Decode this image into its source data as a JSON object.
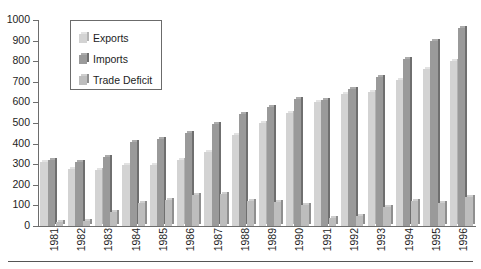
{
  "chart_data": {
    "type": "bar",
    "title": "",
    "xlabel": "",
    "ylabel": "",
    "grid": false,
    "legend_position": "top-left-inset",
    "ylim": [
      0,
      1000
    ],
    "yticks": [
      0,
      100,
      200,
      300,
      400,
      500,
      600,
      700,
      800,
      900,
      1000
    ],
    "categories": [
      "1981",
      "1982",
      "1983",
      "1984",
      "1985",
      "1986",
      "1987",
      "1988",
      "1989",
      "1990",
      "1991",
      "1992",
      "1993",
      "1994",
      "1995",
      "1996"
    ],
    "series": [
      {
        "name": "Exports",
        "color": "#d3d3d3",
        "values": [
          310,
          275,
          270,
          295,
          295,
          320,
          360,
          440,
          500,
          550,
          600,
          640,
          650,
          710,
          760,
          800
        ]
      },
      {
        "name": "Imports",
        "color": "#9a9a9a",
        "values": [
          320,
          310,
          335,
          410,
          420,
          450,
          495,
          545,
          580,
          615,
          610,
          665,
          725,
          810,
          900,
          960
        ]
      },
      {
        "name": "Trade Deficit",
        "color": "#bdbdbd",
        "values": [
          20,
          25,
          70,
          110,
          125,
          150,
          155,
          120,
          115,
          100,
          40,
          50,
          90,
          120,
          110,
          140
        ]
      }
    ]
  },
  "legend": {
    "items": [
      {
        "label": "Exports",
        "series": "exports"
      },
      {
        "label": "Imports",
        "series": "imports"
      },
      {
        "label": "Trade Deficit",
        "series": "deficit"
      }
    ]
  },
  "axes": {
    "y_tick_labels": [
      "1000",
      "900",
      "800",
      "700",
      "600",
      "500",
      "400",
      "300",
      "200",
      "100",
      "0"
    ],
    "x_tick_labels": [
      "1981",
      "1982",
      "1983",
      "1984",
      "1985",
      "1986",
      "1987",
      "1988",
      "1989",
      "1990",
      "1991",
      "1992",
      "1993",
      "1994",
      "1995",
      "1996"
    ]
  }
}
